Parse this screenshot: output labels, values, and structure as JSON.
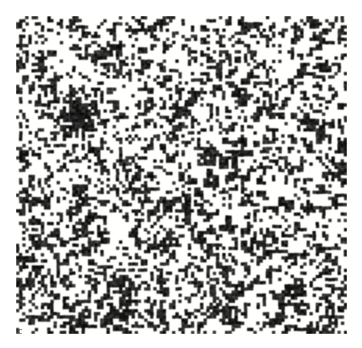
{
  "figure": {
    "panel_label": "c",
    "kind": "binary-raster-pattern",
    "colors": {
      "page_background": "#ffffff",
      "pattern_background": "#f5f5f2",
      "cell_on": "#101010",
      "label_text": "#4a4a4a"
    },
    "pattern": {
      "grid_cols": 106,
      "grid_rows": 102,
      "cell_px": 3.12,
      "fill_fraction": 0.34,
      "seed": 20240617,
      "origin_x_px": 16,
      "origin_y_px": 16,
      "width_px": 331,
      "height_px": 318,
      "clusters": [
        {
          "cx": 20,
          "cy": 31,
          "r": 4.0,
          "boost": 0.92
        },
        {
          "cx": 72,
          "cy": 25,
          "r": 3.0,
          "boost": 0.7
        },
        {
          "cx": 94,
          "cy": 34,
          "r": 3.2,
          "boost": 0.66
        },
        {
          "cx": 48,
          "cy": 60,
          "r": 2.8,
          "boost": 0.58
        },
        {
          "cx": 88,
          "cy": 88,
          "r": 3.4,
          "boost": 0.62
        },
        {
          "cx": 36,
          "cy": 90,
          "r": 2.6,
          "boost": 0.55
        },
        {
          "cx": 62,
          "cy": 44,
          "r": 2.4,
          "boost": 0.5
        }
      ],
      "density_gradient": {
        "top_left": 0.3,
        "top_right": 0.28,
        "bottom_left": 0.37,
        "bottom_right": 0.38
      },
      "diagonal_streak_strength": 0.16
    }
  }
}
